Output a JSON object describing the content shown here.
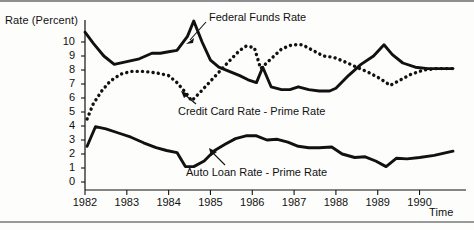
{
  "figure": {
    "background_color": "#fdfdfc",
    "ink_color": "#111111"
  },
  "axes": {
    "ylabel": "Rate (Percent)",
    "xlabel": "Time",
    "y_ticks": [
      "10",
      "9",
      "8",
      "7",
      "6",
      "5",
      "4",
      "3",
      "2",
      "1",
      "0"
    ],
    "x_ticks": [
      "1982",
      "1983",
      "1984",
      "1985",
      "1986",
      "1987",
      "1988",
      "1989",
      "1990"
    ]
  },
  "annotations": {
    "federal_funds": "Federal Funds Rate",
    "credit_card": "Credit Card Rate - Prime Rate",
    "auto_loan": "Auto Loan Rate - Prime Rate"
  },
  "chart_data": {
    "type": "line",
    "title": "",
    "xlabel": "Time",
    "ylabel": "Rate (Percent)",
    "xlim": [
      1982.0,
      1990.8
    ],
    "ylim": [
      0,
      11.9
    ],
    "grid": false,
    "legend": "inline annotations with leader lines",
    "series": [
      {
        "name": "Federal Funds Rate",
        "style": "solid",
        "x": [
          1982.0,
          1982.2,
          1982.45,
          1982.7,
          1983.0,
          1983.3,
          1983.6,
          1983.8,
          1984.0,
          1984.2,
          1984.45,
          1984.6,
          1984.8,
          1985.0,
          1985.2,
          1985.45,
          1985.7,
          1985.9,
          1986.1,
          1986.25,
          1986.45,
          1986.7,
          1986.9,
          1987.1,
          1987.35,
          1987.6,
          1987.85,
          1988.0,
          1988.3,
          1988.6,
          1988.9,
          1989.15,
          1989.35,
          1989.6,
          1989.9,
          1990.2,
          1990.5,
          1990.8
        ],
        "y": [
          10.7,
          9.9,
          9.0,
          8.4,
          8.6,
          8.8,
          9.2,
          9.2,
          9.3,
          9.4,
          10.4,
          11.5,
          10.0,
          8.7,
          8.2,
          7.9,
          7.6,
          7.3,
          7.1,
          8.2,
          6.8,
          6.6,
          6.6,
          6.8,
          6.6,
          6.5,
          6.5,
          6.7,
          7.6,
          8.4,
          9.0,
          9.8,
          9.1,
          8.5,
          8.2,
          8.1,
          8.1,
          8.1
        ]
      },
      {
        "name": "Credit Card Rate - Prime Rate",
        "style": "dotted",
        "x": [
          1982.05,
          1982.2,
          1982.4,
          1982.6,
          1982.85,
          1983.1,
          1983.4,
          1983.7,
          1984.0,
          1984.2,
          1984.4,
          1984.55,
          1984.75,
          1985.0,
          1985.25,
          1985.5,
          1985.7,
          1985.85,
          1986.05,
          1986.2,
          1986.45,
          1986.7,
          1986.95,
          1987.2,
          1987.45,
          1987.7,
          1987.95,
          1988.2,
          1988.5,
          1988.8,
          1989.05,
          1989.3,
          1989.55,
          1989.8,
          1990.1,
          1990.4,
          1990.8
        ],
        "y": [
          4.5,
          5.6,
          6.5,
          7.2,
          7.7,
          7.9,
          7.9,
          7.8,
          7.6,
          7.1,
          6.4,
          5.8,
          6.4,
          7.2,
          8.0,
          8.8,
          9.4,
          9.7,
          9.6,
          8.1,
          8.8,
          9.5,
          9.8,
          9.8,
          9.4,
          9.0,
          8.9,
          8.6,
          8.2,
          7.8,
          7.4,
          6.9,
          7.3,
          7.7,
          8.0,
          8.1,
          8.1
        ]
      },
      {
        "name": "Auto Loan Rate - Prime Rate",
        "style": "solid",
        "x": [
          1982.05,
          1982.25,
          1982.5,
          1982.8,
          1983.1,
          1983.4,
          1983.7,
          1983.95,
          1984.2,
          1984.4,
          1984.6,
          1984.85,
          1985.1,
          1985.35,
          1985.6,
          1985.85,
          1986.1,
          1986.35,
          1986.6,
          1986.85,
          1987.1,
          1987.35,
          1987.6,
          1987.9,
          1988.15,
          1988.45,
          1988.7,
          1988.95,
          1989.2,
          1989.45,
          1989.7,
          1990.0,
          1990.35,
          1990.8
        ],
        "y": [
          2.55,
          3.95,
          3.8,
          3.5,
          3.2,
          2.8,
          2.45,
          2.25,
          2.1,
          1.1,
          1.1,
          1.5,
          2.25,
          2.7,
          3.1,
          3.3,
          3.3,
          3.0,
          3.05,
          2.85,
          2.55,
          2.45,
          2.45,
          2.5,
          2.0,
          1.75,
          1.8,
          1.5,
          1.1,
          1.7,
          1.65,
          1.75,
          1.9,
          2.2
        ]
      }
    ]
  }
}
